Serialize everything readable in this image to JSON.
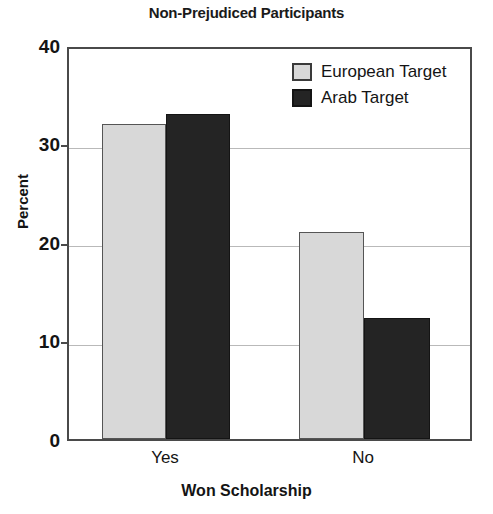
{
  "chart_data": {
    "type": "bar",
    "title": "Non-Prejudiced Participants",
    "xlabel": "Won Scholarship",
    "ylabel": "Percent",
    "categories": [
      "Yes",
      "No"
    ],
    "series": [
      {
        "name": "European Target",
        "values": [
          32,
          21
        ],
        "color": "#d8d8d8"
      },
      {
        "name": "Arab Target",
        "values": [
          33,
          12.3
        ],
        "color": "#242424"
      }
    ],
    "ylim": [
      0,
      40
    ],
    "yticks": [
      0,
      10,
      20,
      30,
      40
    ],
    "ytick_labels": [
      "0",
      "10",
      "20",
      "30",
      "40"
    ],
    "grid": true,
    "legend_position": "top-right"
  },
  "legend": {
    "items": [
      {
        "label": "European Target",
        "swatch": "light"
      },
      {
        "label": "Arab Target",
        "swatch": "dark"
      }
    ]
  },
  "axes": {
    "y_title": "Percent",
    "x_title": "Won Scholarship",
    "y_labels": [
      "40",
      "30",
      "20",
      "10",
      "0"
    ],
    "x_labels": [
      "Yes",
      "No"
    ]
  }
}
